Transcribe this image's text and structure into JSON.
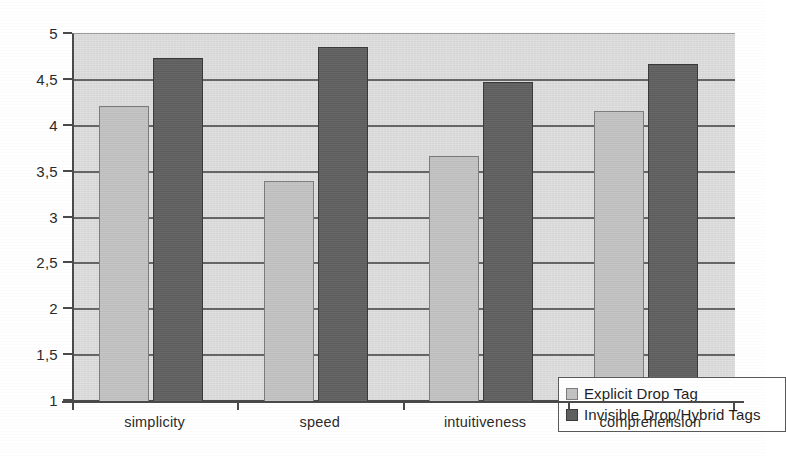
{
  "chart_data": {
    "type": "bar",
    "title": "",
    "subtitle": "",
    "xlabel": "",
    "ylabel": "",
    "categories": [
      "simplicity",
      "speed",
      "intuitiveness",
      "comprehension"
    ],
    "series": [
      {
        "name": "Explicit Drop Tag",
        "color": "#c2c2c2",
        "values": [
          4.21,
          3.4,
          3.67,
          4.16
        ]
      },
      {
        "name": "Invisible Drop/Hybrid Tags",
        "color": "#5f5f5f",
        "values": [
          4.74,
          4.86,
          4.48,
          4.67
        ]
      }
    ],
    "ylim": [
      1,
      5
    ],
    "y_ticks": [
      1,
      1.5,
      2,
      2.5,
      3,
      3.5,
      4,
      4.5,
      5
    ],
    "y_tick_labels": [
      "1",
      "1,5",
      "2",
      "2,5",
      "3",
      "3,5",
      "4",
      "4,5",
      "5"
    ],
    "grid": true,
    "grid_axis": "y",
    "legend_position": "lower-right-inside",
    "plot_background": "#dcdcdc",
    "axis_color": "#4a4a4a",
    "gridline_color": "#666666"
  }
}
